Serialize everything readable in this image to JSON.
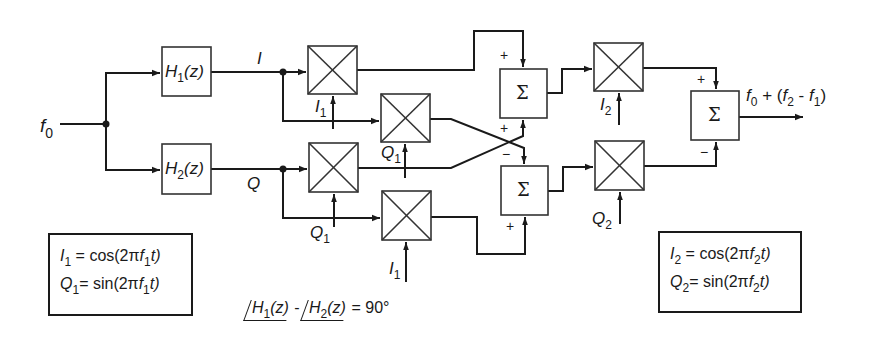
{
  "diagram": {
    "input": {
      "label": "f",
      "sub": "0"
    },
    "filters": [
      {
        "id": "H1",
        "label": "H",
        "sub": "1",
        "suffix": "(z)"
      },
      {
        "id": "H2",
        "label": "H",
        "sub": "2",
        "suffix": "(z)"
      }
    ],
    "signals": {
      "I": "I",
      "Q": "Q"
    },
    "mixer_inputs": [
      {
        "mixer": "m1",
        "label": "I",
        "sub": "1"
      },
      {
        "mixer": "m2",
        "label": "Q",
        "sub": "1"
      },
      {
        "mixer": "m3",
        "label": "Q",
        "sub": "1"
      },
      {
        "mixer": "m4",
        "label": "I",
        "sub": "1"
      },
      {
        "mixer": "m5",
        "label": "I",
        "sub": "2"
      },
      {
        "mixer": "m6",
        "label": "Q",
        "sub": "2"
      }
    ],
    "summers": [
      {
        "id": "sum-upper",
        "symbol": "Σ",
        "signs": [
          "+",
          "+"
        ]
      },
      {
        "id": "sum-lower",
        "symbol": "Σ",
        "signs": [
          "−",
          "+"
        ]
      },
      {
        "id": "sum-final",
        "symbol": "Σ",
        "signs": [
          "+",
          "−"
        ]
      }
    ],
    "output": {
      "f0": "f",
      "f0_sub": "0",
      "plus": " + (",
      "f2": "f",
      "f2_sub": "2",
      "minus": " - ",
      "f1": "f",
      "f1_sub": "1",
      "close": ")"
    },
    "phase_condition": {
      "h1": "H",
      "h1_sub": "1",
      "h1_suffix": "(z)",
      "minus": " - ",
      "h2": "H",
      "h2_sub": "2",
      "h2_suffix": "(z)",
      "equals": " = 90°"
    },
    "legend_left": {
      "row1": {
        "var": "I",
        "sub": "1",
        "eq": " = cos(2π",
        "f": "f",
        "fsub": "1",
        "end": "t)"
      },
      "row2": {
        "var": "Q",
        "sub": "1",
        "eq": "= sin(2π",
        "f": "f",
        "fsub": "1",
        "end": "t)"
      }
    },
    "legend_right": {
      "row1": {
        "var": "I",
        "sub": "2",
        "eq": " = cos(2π",
        "f": "f",
        "fsub": "2",
        "end": "t)"
      },
      "row2": {
        "var": "Q",
        "sub": "2",
        "eq": "= sin(2π",
        "f": "f",
        "fsub": "2",
        "end": "t)"
      }
    },
    "colors": {
      "ink": "#1a1a1a",
      "background": "#ffffff",
      "box_border": "#333333"
    }
  }
}
